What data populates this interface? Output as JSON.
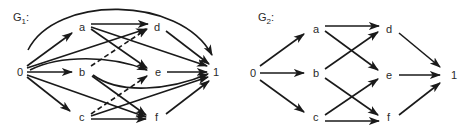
{
  "graphs": [
    {
      "id": "G1",
      "title": {
        "main": "G",
        "sub": "1",
        "suffix": ":"
      },
      "nodes": [
        {
          "id": "0",
          "label": "0",
          "x": 20,
          "y": 72
        },
        {
          "id": "a",
          "label": "a",
          "x": 82,
          "y": 27
        },
        {
          "id": "b",
          "label": "b",
          "x": 82,
          "y": 72
        },
        {
          "id": "c",
          "label": "c",
          "x": 82,
          "y": 117
        },
        {
          "id": "d",
          "label": "d",
          "x": 157,
          "y": 27
        },
        {
          "id": "e",
          "label": "e",
          "x": 158,
          "y": 72
        },
        {
          "id": "f",
          "label": "f",
          "x": 157,
          "y": 117
        },
        {
          "id": "1",
          "label": "1",
          "x": 214,
          "y": 72
        }
      ],
      "edges": [
        {
          "from": "0",
          "to": "a"
        },
        {
          "from": "0",
          "to": "b"
        },
        {
          "from": "0",
          "to": "c"
        },
        {
          "from": "0",
          "to": "d"
        },
        {
          "from": "0",
          "to": "e",
          "curved": true
        },
        {
          "from": "0",
          "to": "f"
        },
        {
          "from": "0",
          "to": "1",
          "curved": true,
          "arc": "top"
        },
        {
          "from": "a",
          "to": "d"
        },
        {
          "from": "a",
          "to": "e"
        },
        {
          "from": "a",
          "to": "1"
        },
        {
          "from": "b",
          "to": "d",
          "dashed": true
        },
        {
          "from": "b",
          "to": "f"
        },
        {
          "from": "b",
          "to": "1",
          "curved": true
        },
        {
          "from": "c",
          "to": "e",
          "dashed": true
        },
        {
          "from": "c",
          "to": "f"
        },
        {
          "from": "c",
          "to": "1"
        },
        {
          "from": "d",
          "to": "1"
        },
        {
          "from": "e",
          "to": "1"
        },
        {
          "from": "f",
          "to": "1"
        }
      ]
    },
    {
      "id": "G2",
      "title": {
        "main": "G",
        "sub": "2",
        "suffix": ":"
      },
      "nodes": [
        {
          "id": "0",
          "label": "0",
          "x": 253,
          "y": 73
        },
        {
          "id": "a",
          "label": "a",
          "x": 316,
          "y": 29
        },
        {
          "id": "b",
          "label": "b",
          "x": 316,
          "y": 73
        },
        {
          "id": "c",
          "label": "c",
          "x": 316,
          "y": 117
        },
        {
          "id": "d",
          "label": "d",
          "x": 389,
          "y": 29
        },
        {
          "id": "e",
          "label": "e",
          "x": 389,
          "y": 75
        },
        {
          "id": "f",
          "label": "f",
          "x": 389,
          "y": 117
        },
        {
          "id": "1",
          "label": "1",
          "x": 453,
          "y": 75
        }
      ],
      "edges": [
        {
          "from": "0",
          "to": "a"
        },
        {
          "from": "0",
          "to": "b"
        },
        {
          "from": "0",
          "to": "c"
        },
        {
          "from": "a",
          "to": "d"
        },
        {
          "from": "a",
          "to": "e"
        },
        {
          "from": "b",
          "to": "d"
        },
        {
          "from": "b",
          "to": "f"
        },
        {
          "from": "c",
          "to": "e"
        },
        {
          "from": "c",
          "to": "f"
        },
        {
          "from": "d",
          "to": "1"
        },
        {
          "from": "e",
          "to": "1"
        },
        {
          "from": "f",
          "to": "1"
        }
      ]
    }
  ],
  "colors": {
    "ink": "#1a1a1a",
    "background": "#ffffff"
  }
}
